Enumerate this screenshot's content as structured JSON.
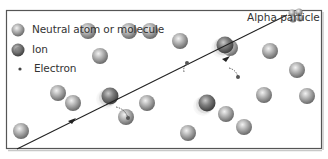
{
  "diagram": {
    "type": "ionization-illustration",
    "frame": {
      "x": 6,
      "y": 10,
      "width": 316,
      "height": 139,
      "stroke": "#555555"
    },
    "legend": {
      "items": [
        {
          "label": "Neutral atom or molecule",
          "icon": "neutral-atom-icon"
        },
        {
          "label": "Ion",
          "icon": "ion-icon"
        },
        {
          "label": "Electron",
          "icon": "electron-icon"
        }
      ]
    },
    "alpha_particle": {
      "label": "Alpha particle",
      "path": {
        "x1": 17,
        "y1": 149,
        "x2": 287,
        "y2": 15
      },
      "color": "#222222"
    },
    "colors": {
      "atom_light": "#e8e8e8",
      "atom_mid": "#a8a8a8",
      "atom_dark": "#6a6a6a",
      "ion_dark": "#4f4f4f",
      "electron": "#555555"
    },
    "neutral_atoms": [
      [
        88,
        31
      ],
      [
        129,
        31
      ],
      [
        150,
        31
      ],
      [
        180,
        41
      ],
      [
        230,
        48
      ],
      [
        270,
        51
      ],
      [
        297,
        70
      ],
      [
        58,
        93
      ],
      [
        73,
        103
      ],
      [
        147,
        103
      ],
      [
        126,
        117
      ],
      [
        307,
        96
      ],
      [
        226,
        114
      ],
      [
        264,
        95
      ],
      [
        188,
        133
      ],
      [
        100,
        56
      ],
      [
        244,
        127
      ],
      [
        21,
        131
      ]
    ],
    "ions": [
      [
        110,
        96
      ],
      [
        225,
        45
      ],
      [
        207,
        103
      ]
    ],
    "electrons": [
      {
        "from": [
          116,
          107
        ],
        "to": [
          128,
          118
        ]
      },
      {
        "from": [
          184,
          72
        ],
        "to": [
          187,
          63
        ]
      },
      {
        "from": [
          229,
          68
        ],
        "to": [
          238,
          77
        ]
      }
    ]
  }
}
